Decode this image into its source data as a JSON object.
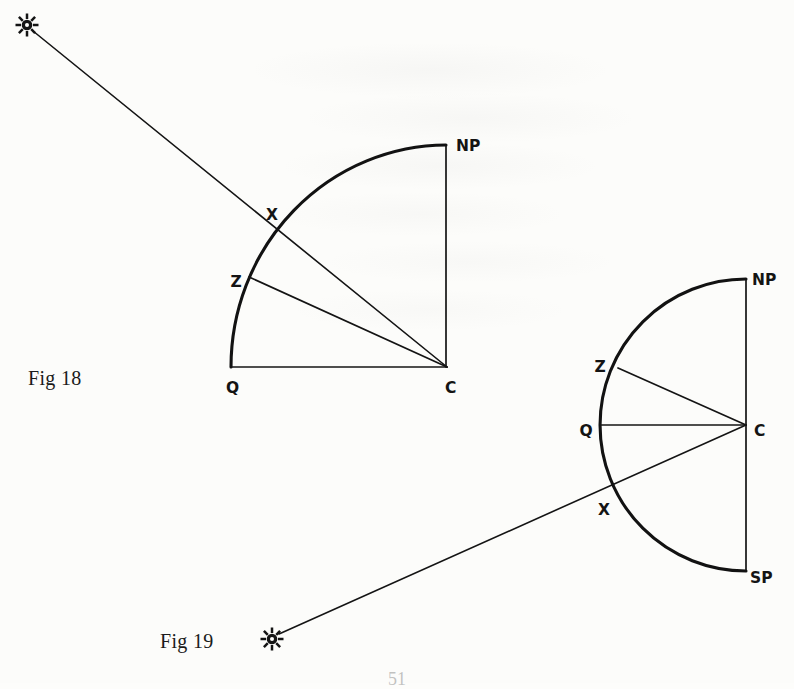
{
  "page": {
    "background_color": "#fcfcfa",
    "ink_color": "#141414",
    "page_number": "51"
  },
  "figures": [
    {
      "id": "fig18",
      "caption": "Fig 18",
      "caption_x": 28,
      "caption_y": 367,
      "shape": "quarter-circle",
      "center": {
        "x": 447,
        "y": 367,
        "label": "C",
        "label_x": 445,
        "label_y": 388
      },
      "radius": 216,
      "points": [
        {
          "name": "NP",
          "label": "NP",
          "x": 446,
          "y": 145,
          "label_x": 456,
          "label_y": 146
        },
        {
          "name": "Q",
          "label": "Q",
          "x": 231,
          "y": 367,
          "label_x": 226,
          "label_y": 388
        },
        {
          "name": "X",
          "label": "X",
          "x": 279,
          "y": 229,
          "label_x": 272,
          "label_y": 215
        },
        {
          "name": "Z",
          "label": "Z",
          "x": 249,
          "y": 277,
          "label_x": 236,
          "label_y": 282
        }
      ],
      "sun": {
        "x": 27,
        "y": 25,
        "glyph": "sun-symbol"
      },
      "rays": [
        {
          "name": "sun-ray-to-center",
          "from": "sun",
          "through": "X",
          "to": "C"
        }
      ],
      "radii_lines": [
        {
          "name": "radius-C-to-Z",
          "from": "C",
          "to": "Z"
        },
        {
          "name": "radius-C-to-Q",
          "from": "C",
          "to": "Q"
        },
        {
          "name": "radius-C-to-NP",
          "from": "C",
          "to": "NP"
        }
      ]
    },
    {
      "id": "fig19",
      "caption": "Fig 19",
      "caption_x": 160,
      "caption_y": 630,
      "shape": "semicircle",
      "center": {
        "x": 746,
        "y": 425,
        "label": "C",
        "label_x": 754,
        "label_y": 431
      },
      "radius": 146,
      "points": [
        {
          "name": "NP",
          "label": "NP",
          "x": 746,
          "y": 279,
          "label_x": 752,
          "label_y": 280
        },
        {
          "name": "SP",
          "label": "SP",
          "x": 746,
          "y": 571,
          "label_x": 750,
          "label_y": 578
        },
        {
          "name": "Q",
          "label": "Q",
          "x": 600,
          "y": 425,
          "label_x": 586,
          "label_y": 431
        },
        {
          "name": "Z",
          "label": "Z",
          "x": 618,
          "y": 368,
          "label_x": 600,
          "label_y": 367
        },
        {
          "name": "X",
          "label": "X",
          "x": 616,
          "y": 481,
          "label_x": 604,
          "label_y": 510
        }
      ],
      "sun": {
        "x": 272,
        "y": 639,
        "glyph": "sun-symbol"
      },
      "rays": [
        {
          "name": "sun-ray-to-center",
          "from": "sun",
          "through": "X",
          "to": "C"
        }
      ],
      "radii_lines": [
        {
          "name": "radius-C-to-Z",
          "from": "C",
          "to": "Z"
        },
        {
          "name": "radius-C-to-Q",
          "from": "C",
          "to": "Q"
        },
        {
          "name": "radius-C-to-NP",
          "from": "C",
          "to": "NP"
        },
        {
          "name": "radius-C-to-SP",
          "from": "C",
          "to": "SP"
        }
      ]
    }
  ]
}
